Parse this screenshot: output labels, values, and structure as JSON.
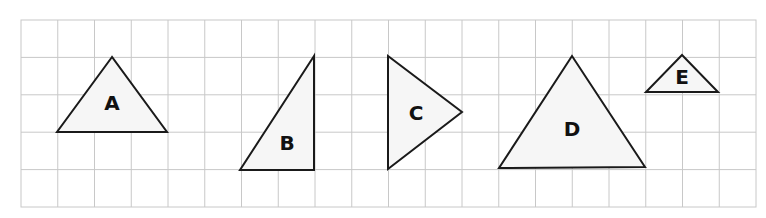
{
  "grid": {
    "x0": 21,
    "y0": 20,
    "x1": 756,
    "y1": 207,
    "cols": 20,
    "rows": 5,
    "line_color": "#c8c8c8"
  },
  "shapes": [
    {
      "label": "A",
      "points": [
        [
          112,
          57
        ],
        [
          57,
          132
        ],
        [
          167,
          132
        ]
      ],
      "label_pos": [
        112,
        103
      ]
    },
    {
      "label": "B",
      "points": [
        [
          314,
          56
        ],
        [
          240,
          170
        ],
        [
          314,
          170
        ]
      ],
      "label_pos": [
        287,
        143
      ]
    },
    {
      "label": "C",
      "points": [
        [
          388,
          56
        ],
        [
          388,
          169
        ],
        [
          462,
          112
        ]
      ],
      "label_pos": [
        416,
        113
      ]
    },
    {
      "label": "D",
      "points": [
        [
          572,
          56
        ],
        [
          499,
          168
        ],
        [
          645,
          167
        ]
      ],
      "label_pos": [
        572,
        129
      ]
    },
    {
      "label": "E",
      "points": [
        [
          682,
          55
        ],
        [
          646,
          92
        ],
        [
          718,
          92
        ]
      ],
      "label_pos": [
        682,
        77
      ]
    }
  ],
  "colors": {
    "fill": "#f6f6f6",
    "stroke": "#1a1a1a",
    "label": "#111111"
  }
}
